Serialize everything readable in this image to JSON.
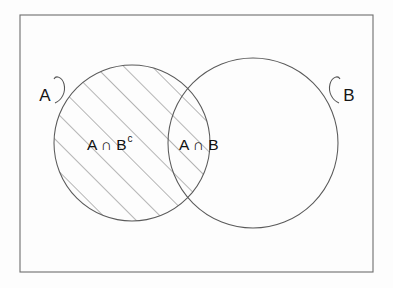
{
  "figure": {
    "kind": "venn-diagram",
    "title_visible": false,
    "background_color": "#fdfdfd",
    "line_color": "#555555",
    "text_color": "#111111"
  },
  "universe": {
    "name": "universal-set-rectangle",
    "x": 20,
    "y": 15,
    "width": 353,
    "height": 257,
    "stroke": "#6e6e6e",
    "stroke_width": 1.1
  },
  "sets": [
    {
      "id": "A",
      "label": "A",
      "cx": 132,
      "cy": 143,
      "r": 78,
      "shaded": true,
      "label_x": 45,
      "label_y": 101,
      "leader_side": "right"
    },
    {
      "id": "B",
      "label": "B",
      "cx": 253,
      "cy": 143,
      "r": 85,
      "shaded": false,
      "label_x": 349,
      "label_y": 101,
      "leader_side": "left"
    }
  ],
  "regions": [
    {
      "id": "A-minus-B",
      "label_base": "A ∩ B",
      "label_sup": "c",
      "label_x": 87,
      "label_y": 150,
      "shaded": true
    },
    {
      "id": "A-and-B",
      "label_base": "A ∩ B",
      "label_sup": "",
      "label_x": 179,
      "label_y": 150,
      "shaded": true
    }
  ],
  "hatching": {
    "name": "diagonal-hatch",
    "angle_degrees": 45,
    "direction": "up-right",
    "spacing_px": 20,
    "stroke": "#5d5d5d",
    "stroke_width": 0.9,
    "applies_to": "circle-A"
  },
  "chart_data": {
    "type": "diagram",
    "diagram_type": "venn",
    "title": "",
    "set_count": 2,
    "sets": [
      "A",
      "B"
    ],
    "shaded_regions": [
      "A ∩ Bᶜ",
      "A ∩ B"
    ],
    "unshaded_regions": [
      "Aᶜ ∩ B",
      "Aᶜ ∩ Bᶜ"
    ],
    "interpretation": "The entire circle A is shaded, comprising the region A ∩ Bᶜ and the lens region A ∩ B.",
    "annotations": [
      "A",
      "B",
      "A ∩ Bᶜ",
      "A ∩ B"
    ]
  }
}
